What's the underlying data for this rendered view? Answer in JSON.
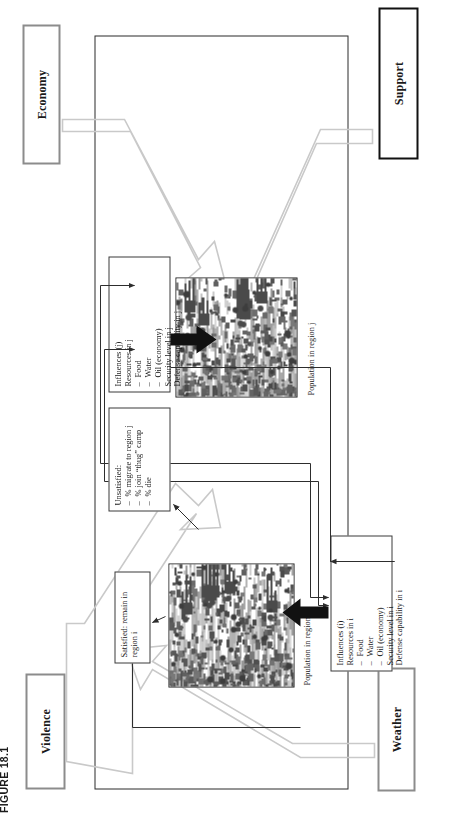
{
  "figure": {
    "caption": "FIGURE 18.1",
    "drivers": [
      {
        "id": "violence",
        "label": "Violence",
        "border": "#8c8c8c"
      },
      {
        "id": "economy",
        "label": "Economy",
        "border": "#8c8c8c"
      },
      {
        "id": "weather",
        "label": "Weather",
        "border": "#8c8c8c"
      },
      {
        "id": "support",
        "label": "Support",
        "border": "#111111"
      }
    ],
    "nodes": {
      "satisfied": {
        "title": "Satisfied: remain in",
        "title2": "region i"
      },
      "unsatisfied": {
        "title": "Unsatisfied:",
        "items": [
          "% migrate to region j",
          "% join “thug” camp",
          "% die"
        ]
      },
      "influences_i": {
        "title": "Influences (i)",
        "subtitle": "Resources in i",
        "items": [
          "Food",
          "Water",
          "Oil (economy)"
        ],
        "extra": [
          "Security level in i",
          "Defense capability in i"
        ]
      },
      "influences_j": {
        "title": "Influences (j)",
        "subtitle": "Resources in j",
        "items": [
          "Food",
          "Water",
          "Oil (economy)"
        ],
        "extra": [
          "Security level in j",
          "Defense capability in j"
        ]
      }
    },
    "labels": {
      "population_i": "Population in region i",
      "population_j": "Population in region j"
    },
    "colors": {
      "frame": "#2b2b2b",
      "node_border": "#3a3a3a",
      "driver_border": "#8c8c8c",
      "driver_border_dark": "#111111",
      "arrow_solid": "#111111",
      "arrow_ghost": "#c9c9c9",
      "raster_base": "#cfcfcf",
      "page": "#ffffff"
    }
  }
}
